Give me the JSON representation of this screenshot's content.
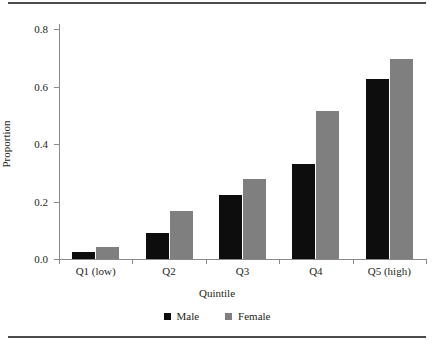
{
  "figure": {
    "background": "#ffffff",
    "rule_color": "#4b4b4d",
    "axis_color": "#8a8a8c"
  },
  "chart_data": {
    "type": "bar",
    "title": "",
    "xlabel": "Quintile",
    "ylabel": "Proportion",
    "categories": [
      "Q1 (low)",
      "Q2",
      "Q3",
      "Q4",
      "Q5 (high)"
    ],
    "series": [
      {
        "name": "Male",
        "color": "#0d0d0d",
        "values": [
          0.025,
          0.091,
          0.224,
          0.331,
          0.627
        ]
      },
      {
        "name": "Female",
        "color": "#7f7f7f",
        "values": [
          0.043,
          0.166,
          0.277,
          0.514,
          0.695
        ]
      }
    ],
    "ylim": [
      0.0,
      0.8
    ],
    "yticks": [
      0.0,
      0.2,
      0.4,
      0.6,
      0.8
    ],
    "ytick_labels": [
      "0.0",
      "0.2",
      "0.4",
      "0.6",
      "0.8"
    ],
    "grid": false,
    "legend_position": "bottom"
  },
  "legend": {
    "items": [
      {
        "label": "Male",
        "color": "#0d0d0d"
      },
      {
        "label": "Female",
        "color": "#7f7f7f"
      }
    ]
  }
}
